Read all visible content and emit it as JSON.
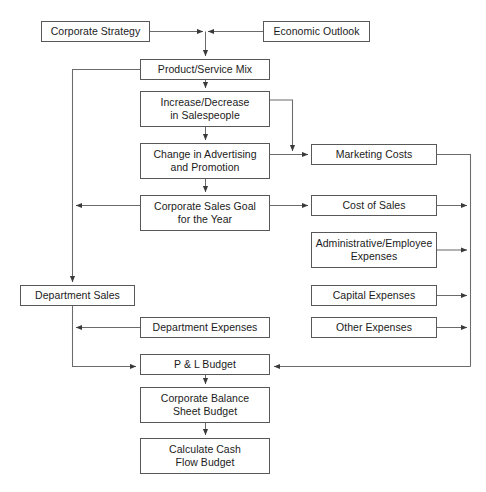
{
  "diagram": {
    "type": "flowchart",
    "stroke_color": "#58585a",
    "text_color": "#1b1b1b",
    "background_color": "#ffffff",
    "nodes": [
      {
        "id": "corporate-strategy",
        "label": "Corporate Strategy",
        "x": 41,
        "y": 21,
        "w": 109,
        "h": 21
      },
      {
        "id": "economic-outlook",
        "label": "Economic Outlook",
        "x": 263,
        "y": 21,
        "w": 107,
        "h": 21
      },
      {
        "id": "product-service-mix",
        "label": "Product/Service Mix",
        "x": 140,
        "y": 59,
        "w": 130,
        "h": 21
      },
      {
        "id": "increase-decrease-salespeople",
        "label": "Increase/Decrease\nin Salespeople",
        "x": 140,
        "y": 91,
        "w": 130,
        "h": 36
      },
      {
        "id": "change-advertising-promotion",
        "label": "Change in Advertising\nand Promotion",
        "x": 140,
        "y": 143,
        "w": 130,
        "h": 36
      },
      {
        "id": "corporate-sales-goal",
        "label": "Corporate Sales Goal\nfor the Year",
        "x": 140,
        "y": 195,
        "w": 130,
        "h": 36
      },
      {
        "id": "marketing-costs",
        "label": "Marketing Costs",
        "x": 311,
        "y": 144,
        "w": 126,
        "h": 21
      },
      {
        "id": "cost-of-sales",
        "label": "Cost of Sales",
        "x": 311,
        "y": 195,
        "w": 126,
        "h": 21
      },
      {
        "id": "administrative-employee-expenses",
        "label": "Administrative/Employee\nExpenses",
        "x": 311,
        "y": 232,
        "w": 126,
        "h": 36
      },
      {
        "id": "capital-expenses",
        "label": "Capital Expenses",
        "x": 311,
        "y": 285,
        "w": 126,
        "h": 21
      },
      {
        "id": "other-expenses",
        "label": "Other Expenses",
        "x": 311,
        "y": 317,
        "w": 126,
        "h": 21
      },
      {
        "id": "department-sales",
        "label": "Department Sales",
        "x": 20,
        "y": 285,
        "w": 115,
        "h": 21
      },
      {
        "id": "department-expenses",
        "label": "Department Expenses",
        "x": 140,
        "y": 317,
        "w": 130,
        "h": 21
      },
      {
        "id": "pl-budget",
        "label": "P & L Budget",
        "x": 140,
        "y": 354,
        "w": 130,
        "h": 21
      },
      {
        "id": "corporate-balance-sheet-budget",
        "label": "Corporate Balance\nSheet Budget",
        "x": 140,
        "y": 387,
        "w": 130,
        "h": 36
      },
      {
        "id": "calculate-cash-flow-budget",
        "label": "Calculate Cash\nFlow Budget",
        "x": 140,
        "y": 438,
        "w": 130,
        "h": 36
      }
    ],
    "edges": [
      {
        "id": "corporate-strategy-to-junction",
        "from": "corporate-strategy",
        "to": "product-service-mix"
      },
      {
        "id": "economic-outlook-to-junction",
        "from": "economic-outlook",
        "to": "product-service-mix"
      },
      {
        "id": "product-service-mix-to-salespeople",
        "from": "product-service-mix",
        "to": "increase-decrease-salespeople"
      },
      {
        "id": "product-service-mix-to-left-bus",
        "from": "product-service-mix",
        "to": "department-sales"
      },
      {
        "id": "salespeople-to-advertising",
        "from": "increase-decrease-salespeople",
        "to": "change-advertising-promotion"
      },
      {
        "id": "salespeople-to-marketing-costs",
        "from": "increase-decrease-salespeople",
        "to": "marketing-costs"
      },
      {
        "id": "advertising-to-marketing-costs",
        "from": "change-advertising-promotion",
        "to": "marketing-costs"
      },
      {
        "id": "advertising-to-corporate-sales-goal",
        "from": "change-advertising-promotion",
        "to": "corporate-sales-goal"
      },
      {
        "id": "corporate-sales-goal-to-left-bus",
        "from": "corporate-sales-goal",
        "to": "department-sales"
      },
      {
        "id": "corporate-sales-goal-to-cost-of-sales",
        "from": "corporate-sales-goal",
        "to": "cost-of-sales"
      },
      {
        "id": "marketing-costs-to-right-bus",
        "from": "marketing-costs",
        "to": "pl-budget"
      },
      {
        "id": "cost-of-sales-to-right-bus",
        "from": "cost-of-sales",
        "to": "pl-budget"
      },
      {
        "id": "administrative-expenses-to-right-bus",
        "from": "administrative-employee-expenses",
        "to": "pl-budget"
      },
      {
        "id": "capital-expenses-to-right-bus",
        "from": "capital-expenses",
        "to": "pl-budget"
      },
      {
        "id": "other-expenses-to-right-bus",
        "from": "other-expenses",
        "to": "pl-budget"
      },
      {
        "id": "department-expenses-to-left-bus",
        "from": "department-expenses",
        "to": "pl-budget"
      },
      {
        "id": "department-sales-to-pl-budget",
        "from": "department-sales",
        "to": "pl-budget"
      },
      {
        "id": "right-bus-to-pl-budget",
        "from": "other-expenses",
        "to": "pl-budget"
      },
      {
        "id": "pl-budget-to-balance-sheet",
        "from": "pl-budget",
        "to": "corporate-balance-sheet-budget"
      },
      {
        "id": "balance-sheet-to-cash-flow",
        "from": "corporate-balance-sheet-budget",
        "to": "calculate-cash-flow-budget"
      }
    ]
  }
}
